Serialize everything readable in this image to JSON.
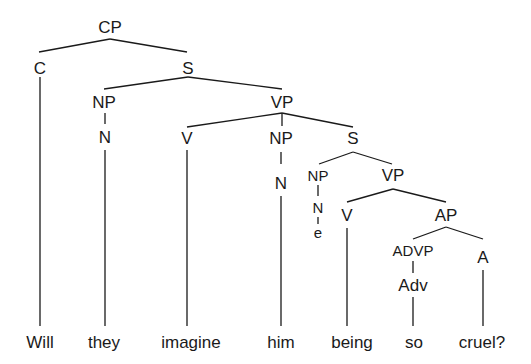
{
  "diagram": {
    "type": "syntax-tree",
    "sentence": "Will they imagine him being so cruel?",
    "nodes": {
      "cp": {
        "label": "CP",
        "x": 110,
        "y": 27
      },
      "c": {
        "label": "C",
        "x": 40,
        "y": 68
      },
      "s1": {
        "label": "S",
        "x": 188,
        "y": 68
      },
      "np1": {
        "label": "NP",
        "x": 104,
        "y": 102
      },
      "n1": {
        "label": "N",
        "x": 105,
        "y": 137
      },
      "vp1": {
        "label": "VP",
        "x": 282,
        "y": 102
      },
      "v1": {
        "label": "V",
        "x": 187,
        "y": 138
      },
      "np2": {
        "label": "NP",
        "x": 281,
        "y": 138
      },
      "n2": {
        "label": "N",
        "x": 281,
        "y": 183
      },
      "s2": {
        "label": "S",
        "x": 353,
        "y": 138
      },
      "np3": {
        "label": "NP",
        "x": 318,
        "y": 175
      },
      "n3": {
        "label": "N",
        "x": 318,
        "y": 207
      },
      "e": {
        "label": "e",
        "x": 318,
        "y": 232
      },
      "vp2": {
        "label": "VP",
        "x": 393,
        "y": 175
      },
      "v2": {
        "label": "V",
        "x": 347,
        "y": 215
      },
      "ap": {
        "label": "AP",
        "x": 446,
        "y": 215
      },
      "advp": {
        "label": "ADVP",
        "x": 413,
        "y": 250
      },
      "adv": {
        "label": "Adv",
        "x": 413,
        "y": 285
      },
      "a": {
        "label": "A",
        "x": 483,
        "y": 257
      }
    },
    "words": [
      {
        "text": "Will",
        "x": 40
      },
      {
        "text": "they",
        "x": 104
      },
      {
        "text": "imagine",
        "x": 191
      },
      {
        "text": "him",
        "x": 281
      },
      {
        "text": "being",
        "x": 352
      },
      {
        "text": "so",
        "x": 414
      },
      {
        "text": "cruel?",
        "x": 482
      }
    ],
    "word_y": 342,
    "line_color": "#1a1a1a"
  }
}
